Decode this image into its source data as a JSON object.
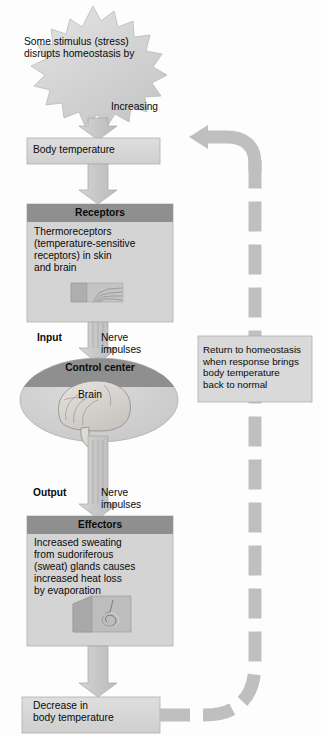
{
  "diagram": {
    "type": "negative-feedback-flowchart",
    "topic": "Homeostatic regulation of body temperature",
    "palette": {
      "box_fill": "#d9d9d9",
      "box_fill_light": "#e3e3e3",
      "header_fill": "#8f8f8f",
      "arrow_fill": "#c9c9c9",
      "arrow_stroke": "#9a9a9a",
      "return_arrow_fill": "#b9b9b9",
      "ellipse_fill": "#d2d2d2",
      "text": "#0a0a0a",
      "background": "#fdfdfd"
    }
  },
  "nodes": {
    "stimulus": {
      "shape": "starburst",
      "text": "Some stimulus (stress)\ndisrupts homeostasis by"
    },
    "increasing": {
      "label": "Increasing"
    },
    "body_temperature": {
      "shape": "rect",
      "text": "Body temperature"
    },
    "receptors": {
      "shape": "titled-box",
      "title": "Receptors",
      "body": "Thermoreceptors\n(temperature-sensitive\nreceptors) in skin\nand brain",
      "illustration": "skin-with-nerve-endings"
    },
    "input": {
      "label": "Input",
      "annotation": "Nerve\nimpulses"
    },
    "control_center": {
      "shape": "ellipse",
      "title": "Control center",
      "body": "Brain",
      "illustration": "brain"
    },
    "output": {
      "label": "Output",
      "annotation": "Nerve\nimpulses"
    },
    "effectors": {
      "shape": "titled-box",
      "title": "Effectors",
      "body": "Increased sweating\nfrom sudoriferous\n(sweat) glands causes\nincreased heat loss\nby evaporation",
      "illustration": "skin-block-with-sweat-gland"
    },
    "decrease": {
      "shape": "rect",
      "text": "Decrease in\nbody temperature"
    },
    "return_note": {
      "shape": "rect",
      "text": "Return to homeostasis\nwhen response brings\nbody temperature\nback to normal"
    }
  },
  "edges": [
    {
      "from": "stimulus",
      "to": "body_temperature",
      "style": "solid-block-arrow",
      "label": "Increasing"
    },
    {
      "from": "body_temperature",
      "to": "receptors",
      "style": "solid-block-arrow"
    },
    {
      "from": "receptors",
      "to": "control_center",
      "style": "solid-block-arrow",
      "label": "Input / Nerve impulses"
    },
    {
      "from": "control_center",
      "to": "effectors",
      "style": "solid-block-arrow",
      "label": "Output / Nerve impulses"
    },
    {
      "from": "effectors",
      "to": "decrease",
      "style": "solid-block-arrow"
    },
    {
      "from": "decrease",
      "to": "body_temperature",
      "style": "dashed-curved-arrow",
      "label": "Return to homeostasis"
    }
  ]
}
